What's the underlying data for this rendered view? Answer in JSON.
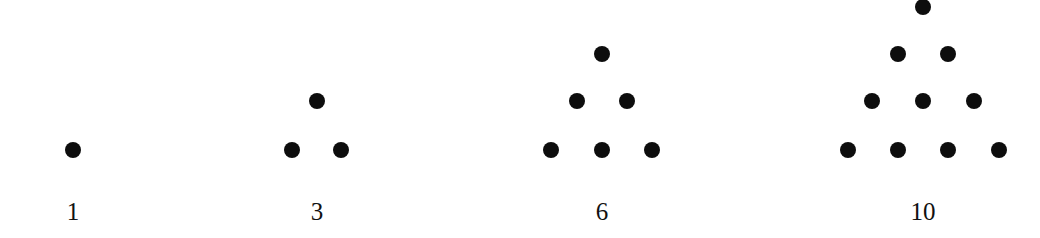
{
  "colors": {
    "dot": "#0d0d0d",
    "text": "#111111",
    "background": "#ffffff"
  },
  "figures": [
    {
      "label": "1",
      "label_pos": [
        73,
        211
      ],
      "dots": [
        [
          73,
          150
        ]
      ]
    },
    {
      "label": "3",
      "label_pos": [
        317,
        211
      ],
      "dots": [
        [
          317,
          101
        ],
        [
          292,
          150
        ],
        [
          341,
          150
        ]
      ]
    },
    {
      "label": "6",
      "label_pos": [
        602,
        211
      ],
      "dots": [
        [
          602,
          54
        ],
        [
          577,
          101
        ],
        [
          627,
          101
        ],
        [
          551,
          150
        ],
        [
          602,
          150
        ],
        [
          652,
          150
        ]
      ]
    },
    {
      "label": "10",
      "label_pos": [
        923,
        211
      ],
      "dots": [
        [
          923,
          7
        ],
        [
          898,
          54
        ],
        [
          948,
          54
        ],
        [
          872,
          101
        ],
        [
          923,
          101
        ],
        [
          974,
          101
        ],
        [
          848,
          150
        ],
        [
          898,
          150
        ],
        [
          948,
          150
        ],
        [
          999,
          150
        ]
      ]
    }
  ]
}
